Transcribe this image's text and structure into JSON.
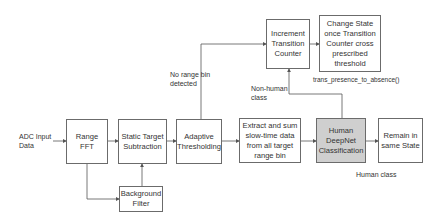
{
  "input": {
    "label": "ADC Input\nData"
  },
  "nodes": {
    "range_fft": "Range FFT",
    "static_target": "Static Target Subtraction",
    "adaptive_threshold": "Adaptive Thresholding",
    "background_filter": "Background Filter",
    "extract_sum": "Extract and sum slow-time data from all target range bin",
    "human_deepnet": "Human DeepNet Classification",
    "remain_state": "Remain in same State",
    "increment_counter": "Increment Transition Counter",
    "change_state": "Change State once Transition Counter cross prescribed threshold"
  },
  "labels": {
    "no_range_bin": "No range bin detected",
    "non_human": "Non-human class",
    "human_class": "Human class",
    "function_name": "trans_presence_to_absence()"
  },
  "colors": {
    "border": "#6b6b6b",
    "highlight": "#cfcfcf",
    "line": "#555555"
  }
}
